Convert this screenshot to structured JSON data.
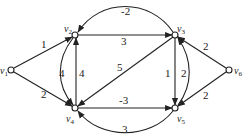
{
  "nodes": [
    {
      "id": "v1",
      "name": "v",
      "sub": "1"
    },
    {
      "id": "v2",
      "name": "v",
      "sub": "2"
    },
    {
      "id": "v3",
      "name": "v",
      "sub": "3"
    },
    {
      "id": "v4",
      "name": "v",
      "sub": "4"
    },
    {
      "id": "v5",
      "name": "v",
      "sub": "5"
    },
    {
      "id": "v6",
      "name": "v",
      "sub": "6"
    }
  ],
  "edges": [
    {
      "from": "v1",
      "to": "v2",
      "weight": "1"
    },
    {
      "from": "v1",
      "to": "v4",
      "weight": "2"
    },
    {
      "from": "v2",
      "to": "v3",
      "weight": "3"
    },
    {
      "from": "v3",
      "to": "v2",
      "weight": "-2"
    },
    {
      "from": "v4",
      "to": "v2",
      "weight": "4"
    },
    {
      "from": "v2",
      "to": "v4",
      "weight": "4"
    },
    {
      "from": "v3",
      "to": "v4",
      "weight": "5"
    },
    {
      "from": "v3",
      "to": "v5",
      "weight": "1"
    },
    {
      "from": "v5",
      "to": "v3",
      "weight": "2"
    },
    {
      "from": "v4",
      "to": "v5",
      "weight": "-3"
    },
    {
      "from": "v5",
      "to": "v4",
      "weight": "3"
    },
    {
      "from": "v6",
      "to": "v3",
      "weight": "2"
    },
    {
      "from": "v6",
      "to": "v5",
      "weight": "2"
    }
  ]
}
